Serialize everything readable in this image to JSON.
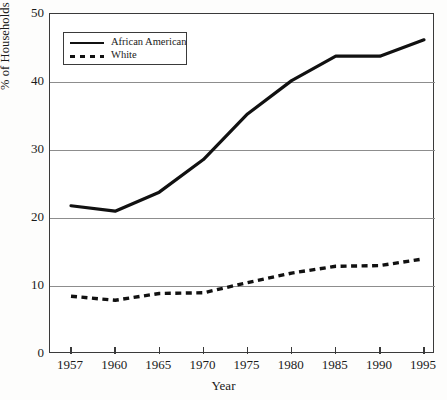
{
  "chart_data": {
    "type": "line",
    "title": "",
    "xlabel": "Year",
    "ylabel": "% of Households Headed by Females",
    "categories": [
      "1957",
      "1960",
      "1965",
      "1970",
      "1975",
      "1980",
      "1985",
      "1990",
      "1995"
    ],
    "xtick_labels": [
      "1957",
      "1960",
      "1965",
      "1970",
      "1975",
      "1980",
      "1985",
      "1990",
      "1995"
    ],
    "ytick_labels": [
      "0",
      "10",
      "20",
      "30",
      "40",
      "50"
    ],
    "ylim": [
      0,
      50
    ],
    "yticks": [
      0,
      10,
      20,
      30,
      40,
      50
    ],
    "grid": "horizontal",
    "legend_position": "top-left-inside",
    "series": [
      {
        "name": "African American",
        "style": "solid",
        "color": "#111111",
        "values": [
          21.8,
          21.0,
          23.8,
          28.6,
          35.3,
          40.2,
          43.8,
          43.8,
          46.2
        ]
      },
      {
        "name": "White",
        "style": "dashed",
        "color": "#111111",
        "values": [
          8.5,
          7.9,
          8.9,
          9.0,
          10.5,
          11.9,
          12.9,
          13.0,
          14.0
        ]
      }
    ]
  },
  "legend": {
    "items": [
      {
        "label": "African American",
        "style": "solid"
      },
      {
        "label": "White",
        "style": "dashed"
      }
    ]
  },
  "axes": {
    "x_title": "Year",
    "y_title": "% of Households Headed by Females"
  }
}
